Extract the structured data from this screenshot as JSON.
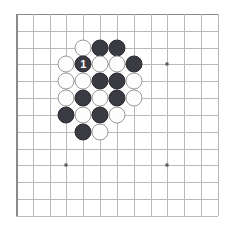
{
  "board": {
    "title": "Go board diagram",
    "game": "Go",
    "board_background_color": "#ffffff",
    "grid_line_color": "#b9b9b9",
    "edge_line_color": "#8a8a8a",
    "black_stone_color": "#3a3a42",
    "white_stone_color": "#fdfdfd",
    "white_stone_border_color": "#9a9a9a",
    "star_point_color": "#555555",
    "columns": 13,
    "rows": 13,
    "origin_x": 16,
    "origin_y": 14,
    "spacing": 16.83,
    "stone_diameter": 17,
    "star_points": [
      {
        "name": "star-point-upper-right",
        "col": 9,
        "row": 3
      },
      {
        "name": "star-point-lower-left",
        "col": 3,
        "row": 9
      },
      {
        "name": "star-point-lower-right",
        "col": 9,
        "row": 9
      }
    ],
    "stones": [
      {
        "id": "stone-w-c4r2",
        "color": "white",
        "col": 4,
        "row": 2,
        "label": ""
      },
      {
        "id": "stone-b-c5r2",
        "color": "black",
        "col": 5,
        "row": 2,
        "label": ""
      },
      {
        "id": "stone-b-c6r2",
        "color": "black",
        "col": 6,
        "row": 2,
        "label": ""
      },
      {
        "id": "stone-w-c3r3",
        "color": "white",
        "col": 3,
        "row": 3,
        "label": ""
      },
      {
        "id": "stone-b-c4r3",
        "color": "black",
        "col": 4,
        "row": 3,
        "label": "1"
      },
      {
        "id": "stone-w-c5r3",
        "color": "white",
        "col": 5,
        "row": 3,
        "label": ""
      },
      {
        "id": "stone-w-c6r3",
        "color": "white",
        "col": 6,
        "row": 3,
        "label": ""
      },
      {
        "id": "stone-b-c7r3",
        "color": "black",
        "col": 7,
        "row": 3,
        "label": ""
      },
      {
        "id": "stone-w-c3r4",
        "color": "white",
        "col": 3,
        "row": 4,
        "label": ""
      },
      {
        "id": "stone-w-c4r4",
        "color": "white",
        "col": 4,
        "row": 4,
        "label": ""
      },
      {
        "id": "stone-b-c5r4",
        "color": "black",
        "col": 5,
        "row": 4,
        "label": ""
      },
      {
        "id": "stone-b-c6r4",
        "color": "black",
        "col": 6,
        "row": 4,
        "label": ""
      },
      {
        "id": "stone-w-c7r4",
        "color": "white",
        "col": 7,
        "row": 4,
        "label": ""
      },
      {
        "id": "stone-w-c3r5",
        "color": "white",
        "col": 3,
        "row": 5,
        "label": ""
      },
      {
        "id": "stone-b-c4r5",
        "color": "black",
        "col": 4,
        "row": 5,
        "label": ""
      },
      {
        "id": "stone-w-c5r5",
        "color": "white",
        "col": 5,
        "row": 5,
        "label": ""
      },
      {
        "id": "stone-b-c6r5",
        "color": "black",
        "col": 6,
        "row": 5,
        "label": ""
      },
      {
        "id": "stone-w-c7r5",
        "color": "white",
        "col": 7,
        "row": 5,
        "label": ""
      },
      {
        "id": "stone-b-c3r6",
        "color": "black",
        "col": 3,
        "row": 6,
        "label": ""
      },
      {
        "id": "stone-w-c4r6",
        "color": "white",
        "col": 4,
        "row": 6,
        "label": ""
      },
      {
        "id": "stone-b-c5r6",
        "color": "black",
        "col": 5,
        "row": 6,
        "label": ""
      },
      {
        "id": "stone-w-c6r6",
        "color": "white",
        "col": 6,
        "row": 6,
        "label": ""
      },
      {
        "id": "stone-b-c4r7",
        "color": "black",
        "col": 4,
        "row": 7,
        "label": ""
      },
      {
        "id": "stone-w-c5r7",
        "color": "white",
        "col": 5,
        "row": 7,
        "label": ""
      }
    ],
    "move_marker": {
      "number": "1",
      "on_stone": "stone-b-c4r3",
      "text_color": "#ffffff"
    }
  }
}
